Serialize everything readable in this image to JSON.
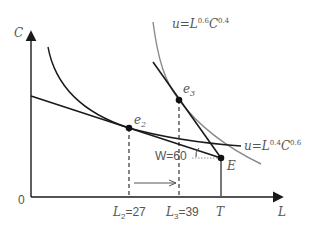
{
  "diagram": {
    "type": "labor-leisure consumption choice",
    "axes": {
      "y_label": "C",
      "x_label": "L",
      "origin_label": "0"
    },
    "points": {
      "e2": {
        "label": "e",
        "sub": "2"
      },
      "e3": {
        "label": "e",
        "sub": "3"
      },
      "E": {
        "label": "E"
      }
    },
    "x_ticks": {
      "L2": {
        "var": "L",
        "sub": "2",
        "eq": "=27"
      },
      "L3": {
        "var": "L",
        "sub": "3",
        "eq": "=39"
      },
      "T": {
        "label": "T"
      }
    },
    "curves": {
      "u1": {
        "prefix": "u=L",
        "exp1": "0.6",
        "mid": "C",
        "exp2": "0.4"
      },
      "u2": {
        "prefix": "u=L",
        "exp1": "0.4",
        "mid": "C",
        "exp2": "0.6"
      }
    },
    "wage_label": "W=60",
    "colors": {
      "black_line": "#1a1a1a",
      "gray_curve": "#8a8a8a",
      "text": "#555555"
    }
  }
}
